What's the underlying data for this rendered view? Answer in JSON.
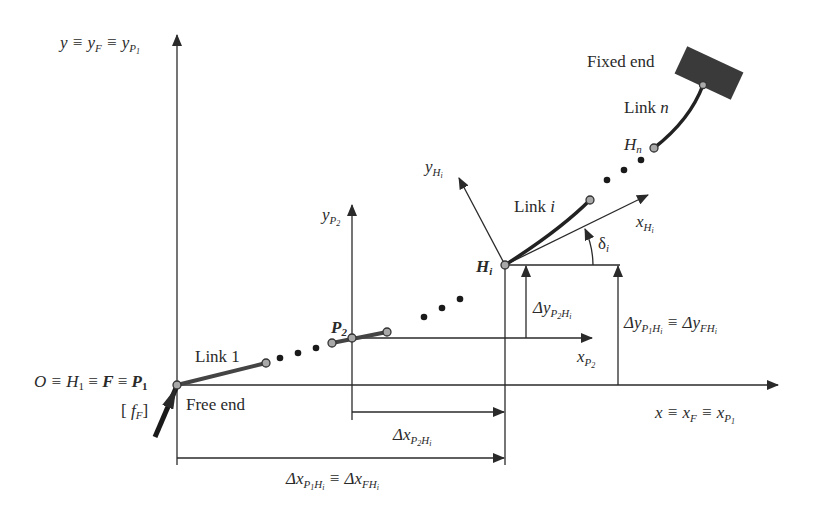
{
  "diagram": {
    "type": "kinematic chain coordinate frames",
    "labels": {
      "global_y_axis": {
        "base": "y ≡ y",
        "sub1": "F",
        "mid": " ≡ y",
        "sub2": "P",
        "subsub2": "1"
      },
      "global_x_axis": {
        "base": "x ≡ x",
        "sub1": "F",
        "mid": " ≡ x",
        "sub2": "P",
        "subsub2": "1"
      },
      "origin": {
        "text1": "O ≡ H",
        "sub1": "1",
        "text2": " ≡ ",
        "F": "F",
        "text3": " ≡ ",
        "P": "P",
        "subP": "1"
      },
      "force": {
        "open": "[ ",
        "f": "f",
        "sub": "F",
        "close": "]"
      },
      "free_end": "Free end",
      "fixed_end": "Fixed end",
      "link_1": "Link 1",
      "link_i": {
        "text": "Link ",
        "var": "i"
      },
      "link_n": {
        "text": "Link ",
        "var": "n"
      },
      "p2": {
        "text": "P",
        "sub": "2"
      },
      "hi": {
        "text": "H",
        "sub": "i"
      },
      "hn": {
        "text": "H",
        "sub": "n"
      },
      "y_p2": {
        "base": "y",
        "sub": "P",
        "subsub": "2"
      },
      "x_p2": {
        "base": "x",
        "sub": "P",
        "subsub": "2"
      },
      "y_hi": {
        "base": "y",
        "sub": "H",
        "subsub": "i"
      },
      "x_hi": {
        "base": "x",
        "sub": "H",
        "subsub": "i"
      },
      "delta_i": {
        "text": "δ",
        "sub": "i"
      },
      "dy_p2hi": {
        "base": "Δy",
        "sub1": "P",
        "subsub1": "2",
        "sub2": "H",
        "subsub2": "i"
      },
      "dy_p1hi": {
        "base": "Δy",
        "sub1": "P",
        "subsub1": "1",
        "sub2": "H",
        "subsub2": "i",
        "eq": " ≡ Δy",
        "sub3": "FH",
        "subsub3": "i"
      },
      "dx_p2hi": {
        "base": "Δx",
        "sub1": "P",
        "subsub1": "2",
        "sub2": "H",
        "subsub2": "i"
      },
      "dx_p1hi": {
        "base": "Δx",
        "sub1": "P",
        "subsub1": "1",
        "sub2": "H",
        "subsub2": "i",
        "eq": " ≡ Δx",
        "sub3": "FH",
        "subsub3": "i"
      }
    },
    "colors": {
      "line": "#2a2a2a",
      "joint_fill": "#a8a8a8",
      "fixed_block": "#3a3a3a",
      "background": "#ffffff"
    }
  }
}
